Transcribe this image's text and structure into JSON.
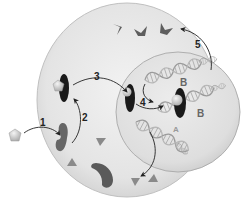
{
  "diagram": {
    "type": "cell-signaling",
    "colors": {
      "background": "#ffffff",
      "cytoplasm": "#e6e6e6",
      "cytoplasm_edge": "#c4c4c4",
      "nucleus": "#dcdcdc",
      "nucleus_edge": "#a8a8a8",
      "receptor_inactive": "#6e6e6e",
      "receptor_active": "#1c1c1c",
      "hormone": "#d0d0d0",
      "protein": "#5a5a5a",
      "triangle": "#8a8a8a",
      "dna": "#bdbdbd",
      "arrow": "#222222"
    },
    "step_labels": [
      {
        "id": "1",
        "text": "1"
      },
      {
        "id": "2",
        "text": "2"
      },
      {
        "id": "3",
        "text": "3"
      },
      {
        "id": "4",
        "text": "4"
      },
      {
        "id": "5",
        "text": "5"
      }
    ],
    "dna_labels": [
      {
        "id": "B-top",
        "text": "B"
      },
      {
        "id": "B-bound",
        "text": "B"
      },
      {
        "id": "A",
        "text": "A"
      }
    ],
    "nodes": [
      {
        "id": "hormone-outside",
        "label": "hormone (pentagon)"
      },
      {
        "id": "receptor-unbound",
        "label": "receptor"
      },
      {
        "id": "receptor-hormone-complex",
        "label": "hormone-receptor complex"
      },
      {
        "id": "complex-in-nucleus",
        "label": "complex entering nucleus"
      },
      {
        "id": "dna-B-top",
        "label": "DNA gene B"
      },
      {
        "id": "dna-B-bound",
        "label": "DNA gene B with bound complex"
      },
      {
        "id": "dna-A",
        "label": "DNA gene A"
      },
      {
        "id": "protein-products",
        "label": "proteins (chevrons)"
      },
      {
        "id": "triangles",
        "label": "small molecules (triangles)"
      }
    ],
    "edges": [
      {
        "from": "hormone-outside",
        "to": "receptor-unbound",
        "label": "1"
      },
      {
        "from": "receptor-unbound",
        "to": "receptor-hormone-complex",
        "label": "2"
      },
      {
        "from": "receptor-hormone-complex",
        "to": "complex-in-nucleus",
        "label": "3"
      },
      {
        "from": "complex-in-nucleus",
        "to": "dna-B-bound",
        "label": "4"
      },
      {
        "from": "dna-B-top",
        "to": "dna-B-bound",
        "label": ""
      },
      {
        "from": "dna-B-top",
        "to": "protein-products",
        "label": "5"
      },
      {
        "from": "dna-A",
        "to": "triangles",
        "label": ""
      }
    ]
  }
}
